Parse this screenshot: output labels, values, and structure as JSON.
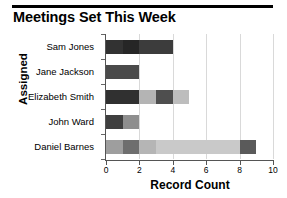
{
  "chart_data": {
    "type": "bar",
    "orientation": "horizontal",
    "stacked": true,
    "title": "Meetings Set This Week",
    "xlabel": "Record Count",
    "ylabel": "Assigned",
    "categories": [
      "Sam Jones",
      "Jane Jackson",
      "Elizabeth Smith",
      "John Ward",
      "Daniel Barnes"
    ],
    "values": [
      4,
      2,
      5,
      2,
      9
    ],
    "xlim": [
      0,
      10
    ],
    "xticks": [
      0,
      2,
      4,
      6,
      8,
      10
    ],
    "xticklabels": [
      "0",
      "2",
      "4",
      "6",
      "8",
      "10"
    ],
    "grid": true,
    "legend": "none",
    "bars": [
      {
        "category": "Sam Jones",
        "total": 4,
        "segments": [
          {
            "start": 0,
            "end": 1,
            "color": "#323232"
          },
          {
            "start": 1,
            "end": 2,
            "color": "#262626"
          },
          {
            "start": 2,
            "end": 4,
            "color": "#3c3c3c"
          }
        ]
      },
      {
        "category": "Jane Jackson",
        "total": 2,
        "segments": [
          {
            "start": 0,
            "end": 2,
            "color": "#4a4a4a"
          }
        ]
      },
      {
        "category": "Elizabeth Smith",
        "total": 5,
        "segments": [
          {
            "start": 0,
            "end": 2,
            "color": "#303030"
          },
          {
            "start": 2,
            "end": 3,
            "color": "#b4b4b4"
          },
          {
            "start": 3,
            "end": 4,
            "color": "#4e4e4e"
          },
          {
            "start": 4,
            "end": 5,
            "color": "#bdbdbd"
          }
        ]
      },
      {
        "category": "John Ward",
        "total": 2,
        "segments": [
          {
            "start": 0,
            "end": 1,
            "color": "#3f3f3f"
          },
          {
            "start": 1,
            "end": 2,
            "color": "#8e8e8e"
          }
        ]
      },
      {
        "category": "Daniel Barnes",
        "total": 9,
        "segments": [
          {
            "start": 0,
            "end": 1,
            "color": "#9e9e9e"
          },
          {
            "start": 1,
            "end": 2,
            "color": "#6e6e6e"
          },
          {
            "start": 2,
            "end": 3,
            "color": "#b5b5b5"
          },
          {
            "start": 3,
            "end": 8,
            "color": "#c9c9c9"
          },
          {
            "start": 8,
            "end": 9,
            "color": "#5a5a5a"
          }
        ]
      }
    ]
  },
  "colors": {
    "axis": "#555555",
    "grid": "#d9d9d9",
    "text": "#000000",
    "background": "#ffffff"
  }
}
